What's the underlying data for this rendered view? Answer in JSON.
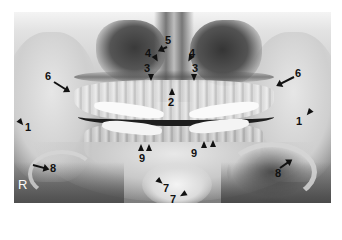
{
  "figure": {
    "type": "panoramic dental radiograph",
    "side_marker": "R",
    "labels": [
      {
        "id": "1-left",
        "text": "1"
      },
      {
        "id": "1-right",
        "text": "1"
      },
      {
        "id": "2",
        "text": "2"
      },
      {
        "id": "3-left",
        "text": "3"
      },
      {
        "id": "3-right",
        "text": "3"
      },
      {
        "id": "4-left",
        "text": "4"
      },
      {
        "id": "4-right",
        "text": "4"
      },
      {
        "id": "5",
        "text": "5"
      },
      {
        "id": "6-left",
        "text": "6"
      },
      {
        "id": "6-right",
        "text": "6"
      },
      {
        "id": "7-upper",
        "text": "7"
      },
      {
        "id": "7-lower",
        "text": "7"
      },
      {
        "id": "8-left",
        "text": "8"
      },
      {
        "id": "8-right",
        "text": "8"
      },
      {
        "id": "9-left",
        "text": "9"
      },
      {
        "id": "9-right",
        "text": "9"
      }
    ]
  }
}
